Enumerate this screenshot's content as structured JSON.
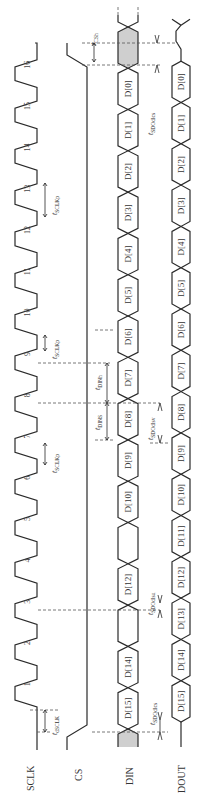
{
  "diagram": {
    "type": "timing-diagram",
    "orientation": "rotated-90-ccw",
    "signals": [
      {
        "id": "sclk",
        "label": "SCLK"
      },
      {
        "id": "cs",
        "label": "CS"
      },
      {
        "id": "din",
        "label": "DIN"
      },
      {
        "id": "dout",
        "label": "DOUT"
      }
    ],
    "clock_pulses": [
      "1",
      "2",
      "3",
      "4",
      "5",
      "6",
      "7",
      "8",
      "9",
      "10",
      "11",
      "12",
      "13",
      "14",
      "15",
      "16"
    ],
    "din_bits": [
      "D[15]",
      "D[14]",
      "",
      "D[12]",
      "",
      "D[10]",
      "D[9]",
      "D[8]",
      "D[7]",
      "D[6]",
      "D[5]",
      "D[4]",
      "D[3]",
      "D[2]",
      "D[1]",
      "D[0]"
    ],
    "dout_bits": [
      "D[15]",
      "D[14]",
      "D[13]",
      "D[12]",
      "D[11]",
      "D[10]",
      "D[9]",
      "D[8]",
      "D[7]",
      "D[6]",
      "D[5]",
      "D[4]",
      "D[3]",
      "D[2]",
      "D[1]",
      "D[0]"
    ],
    "timing_labels": {
      "t_dsclk": {
        "t": "t",
        "sub": "dSCLK"
      },
      "t_sclkp_7": {
        "t": "t",
        "sub": "SCLKp"
      },
      "t_sclkp_9": {
        "t": "t",
        "sub": "SCLKp"
      },
      "t_sclkp_12": {
        "t": "t",
        "sub": "SCLKp"
      },
      "t_csh": {
        "t": "t",
        "sub": "CSh"
      },
      "t_dins": {
        "t": "t",
        "sub": "DINS"
      },
      "t_dinh": {
        "t": "t",
        "sub": "DINh"
      },
      "t_sdodlcs": {
        "t": "t",
        "sub": "SDOdlcs"
      },
      "t_sdodlsu_a": {
        "t": "t",
        "sub": "SDOdlsu"
      },
      "t_sdodlsv": {
        "t": "t",
        "sub": "SDOdlsv"
      },
      "t_sdodlsu_b": {
        "t": "t",
        "sub": "SDOdlsu"
      },
      "t_sdodlcs_end": {
        "t": "t",
        "sub": "SDOdlcs"
      }
    },
    "colors": {
      "line": "#2a2a2a",
      "dont_care_fill": "#cfcfcf",
      "background": "#ffffff"
    }
  }
}
